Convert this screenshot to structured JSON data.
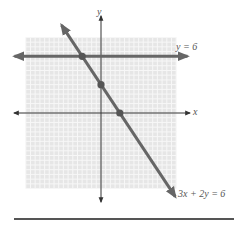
{
  "chart_data": {
    "type": "line",
    "title": "",
    "xlabel": "x",
    "ylabel": "y",
    "xlim": [
      -8,
      8
    ],
    "ylim": [
      -8,
      8
    ],
    "grid": true,
    "series": [
      {
        "name": "y = 6",
        "equation": "y = 6",
        "x": [
          -9.2,
          9.2
        ],
        "y": [
          6,
          6
        ],
        "label": "y = 6"
      },
      {
        "name": "3x + 2y = 6",
        "equation": "3x + 2y = 6",
        "x": [
          -4.2,
          7.9
        ],
        "y": [
          9.3,
          -8.85
        ],
        "label": "3x + 2y = 6"
      }
    ],
    "points": [
      {
        "x": -2,
        "y": 6,
        "note": "intersection"
      },
      {
        "x": 0,
        "y": 3,
        "note": "y-intercept"
      },
      {
        "x": 2,
        "y": 0,
        "note": "x-intercept"
      }
    ]
  },
  "labels": {
    "x_axis": "x",
    "y_axis": "y",
    "line1": "y = 6",
    "line2": "3x + 2y = 6"
  },
  "colors": {
    "grid_bg": "#e6e6e6",
    "grid_line": "#f7f7f7",
    "axis": "#333333",
    "line": "#666666",
    "point": "#555555"
  }
}
